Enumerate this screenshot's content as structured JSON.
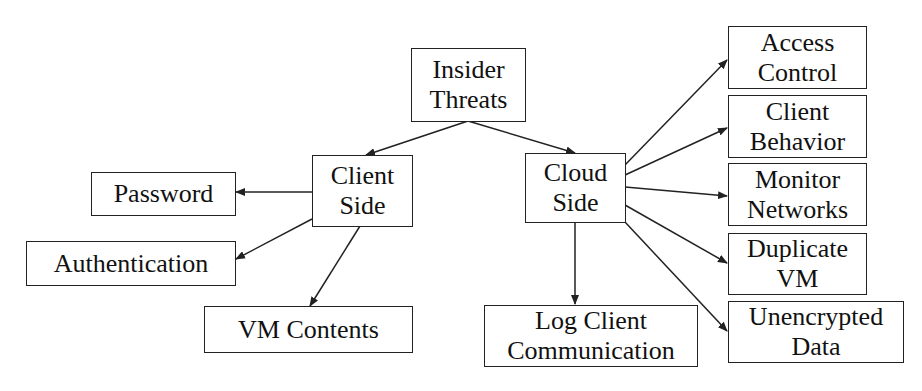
{
  "diagram": {
    "type": "tree",
    "root": {
      "id": "insider",
      "lines": [
        "Insider",
        "Threats"
      ]
    },
    "nodes": {
      "insider": {
        "lines": [
          "Insider",
          "Threats"
        ]
      },
      "client_side": {
        "lines": [
          "Client",
          "Side"
        ]
      },
      "cloud_side": {
        "lines": [
          "Cloud",
          "Side"
        ]
      },
      "password": {
        "lines": [
          "Password"
        ]
      },
      "authentication": {
        "lines": [
          "Authentication"
        ]
      },
      "vm_contents": {
        "lines": [
          "VM Contents"
        ]
      },
      "log_client": {
        "lines": [
          "Log Client",
          "Communication"
        ]
      },
      "access_control": {
        "lines": [
          "Access",
          "Control"
        ]
      },
      "client_behavior": {
        "lines": [
          "Client",
          "Behavior"
        ]
      },
      "monitor_networks": {
        "lines": [
          "Monitor",
          "Networks"
        ]
      },
      "duplicate_vm": {
        "lines": [
          "Duplicate",
          "VM"
        ]
      },
      "unencrypted_data": {
        "lines": [
          "Unencrypted",
          "Data"
        ]
      }
    },
    "edges": [
      [
        "insider",
        "client_side"
      ],
      [
        "insider",
        "cloud_side"
      ],
      [
        "client_side",
        "password"
      ],
      [
        "client_side",
        "authentication"
      ],
      [
        "client_side",
        "vm_contents"
      ],
      [
        "cloud_side",
        "log_client"
      ],
      [
        "cloud_side",
        "access_control"
      ],
      [
        "cloud_side",
        "client_behavior"
      ],
      [
        "cloud_side",
        "monitor_networks"
      ],
      [
        "cloud_side",
        "duplicate_vm"
      ],
      [
        "cloud_side",
        "unencrypted_data"
      ]
    ],
    "colors": {
      "line": "#222222",
      "background": "#ffffff",
      "text": "#111111"
    }
  }
}
